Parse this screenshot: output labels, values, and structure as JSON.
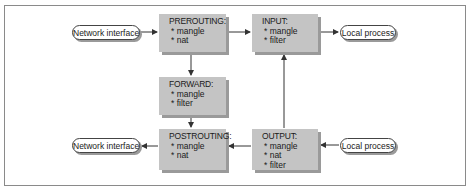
{
  "diagram": {
    "nodes": {
      "net_in": {
        "label": "Network interface"
      },
      "net_out": {
        "label": "Network interface"
      },
      "local_in": {
        "label": "Local process"
      },
      "local_out": {
        "label": "Local process"
      },
      "prerouting": {
        "title": "PREROUTING:",
        "items": [
          "* mangle",
          "* nat"
        ]
      },
      "input": {
        "title": "INPUT:",
        "items": [
          "* mangle",
          "* filter"
        ]
      },
      "forward": {
        "title": "FORWARD:",
        "items": [
          "* mangle",
          "* filter"
        ]
      },
      "postrouting": {
        "title": "POSTROUTING:",
        "items": [
          "* mangle",
          "* nat"
        ]
      },
      "output": {
        "title": "OUTPUT:",
        "items": [
          "* mangle",
          "* nat",
          "* filter"
        ]
      }
    },
    "edges": [
      {
        "from": "net_in",
        "to": "prerouting"
      },
      {
        "from": "prerouting",
        "to": "input"
      },
      {
        "from": "input",
        "to": "local_in"
      },
      {
        "from": "prerouting",
        "to": "forward"
      },
      {
        "from": "forward",
        "to": "postrouting"
      },
      {
        "from": "postrouting",
        "to": "net_out"
      },
      {
        "from": "output",
        "to": "postrouting"
      },
      {
        "from": "output",
        "to": "input"
      },
      {
        "from": "local_out",
        "to": "output"
      }
    ],
    "colors": {
      "box_fill": "#c4c4c4",
      "box_shadow": "#9a9a9a",
      "line": "#333333",
      "frame": "#8a8a8a"
    }
  }
}
